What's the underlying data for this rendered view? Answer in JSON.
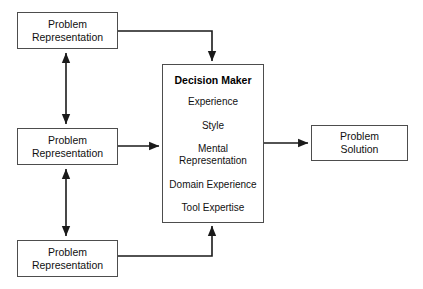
{
  "diagram": {
    "background_color": "#ffffff",
    "border_color": "#4d4d4d",
    "connector_color": "#1a1a1a",
    "nodes": {
      "problem_representation_top": {
        "line1": "Problem",
        "line2": "Representation"
      },
      "problem_representation_middle": {
        "line1": "Problem",
        "line2": "Representation"
      },
      "problem_representation_bottom": {
        "line1": "Problem",
        "line2": "Representation"
      },
      "problem_solution": {
        "line1": "Problem",
        "line2": "Solution"
      },
      "decision_maker": {
        "title": "Decision Maker",
        "items": [
          "Experience",
          "Style",
          "Mental\nRepresentation",
          "Domain Experience",
          "Tool Expertise"
        ]
      }
    },
    "edges": [
      {
        "name": "top-representation-to-decision-maker",
        "from": "problem_representation_top",
        "to": "decision_maker",
        "style": "elbow",
        "arrowheads": "single"
      },
      {
        "name": "middle-representation-to-decision-maker",
        "from": "problem_representation_middle",
        "to": "decision_maker",
        "style": "straight",
        "arrowheads": "single"
      },
      {
        "name": "bottom-representation-to-decision-maker",
        "from": "problem_representation_bottom",
        "to": "decision_maker",
        "style": "elbow",
        "arrowheads": "single"
      },
      {
        "name": "decision-maker-to-problem-solution",
        "from": "decision_maker",
        "to": "problem_solution",
        "style": "straight",
        "arrowheads": "single"
      },
      {
        "name": "top-middle-representation-link",
        "from": "problem_representation_top",
        "to": "problem_representation_middle",
        "style": "straight",
        "arrowheads": "double"
      },
      {
        "name": "middle-bottom-representation-link",
        "from": "problem_representation_middle",
        "to": "problem_representation_bottom",
        "style": "straight",
        "arrowheads": "double"
      }
    ]
  }
}
